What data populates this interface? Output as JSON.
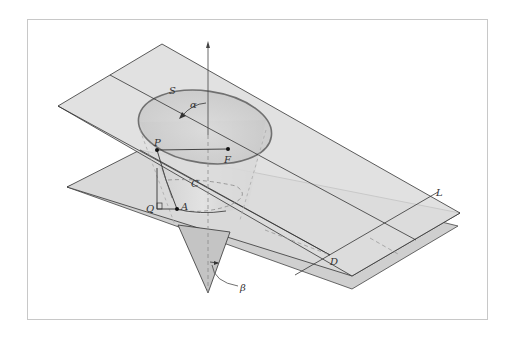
{
  "figure": {
    "labels": {
      "S": "S",
      "alpha": "α",
      "P": "P",
      "F": "F",
      "C": "C",
      "Q": "Q",
      "A": "A",
      "L": "L",
      "D": "D",
      "beta": "β"
    }
  },
  "colors": {
    "plane_fill": "#d4d4d4",
    "plane_fill_light": "#dedede",
    "cone_fill": "#c4c4c4",
    "line": "#333333",
    "ellipse_stroke": "#707070",
    "dashed": "#9a9a9a",
    "frame_border": "#c8c8c8"
  }
}
